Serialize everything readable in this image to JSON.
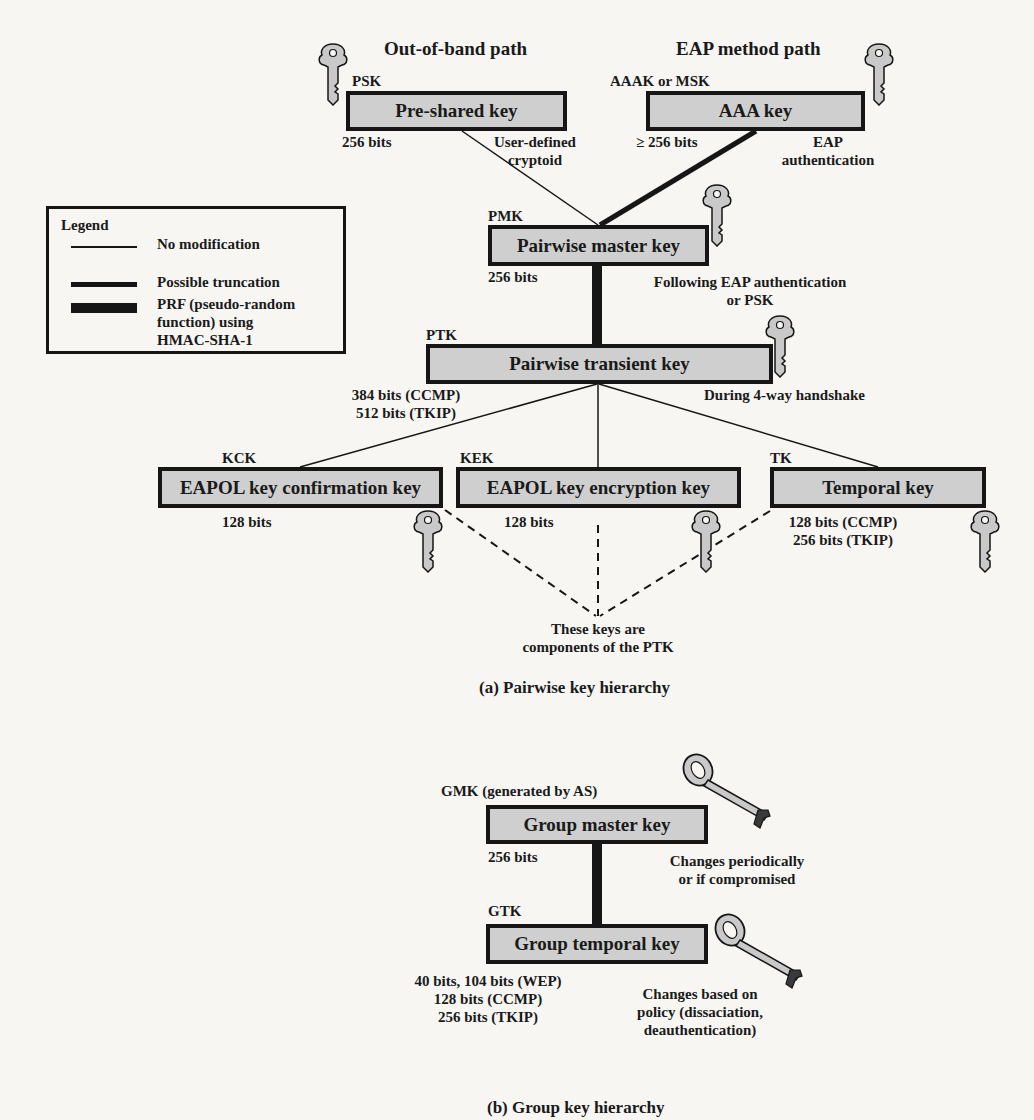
{
  "pairwise": {
    "paths": {
      "out_of_band": "Out-of-band path",
      "eap_method": "EAP method path"
    },
    "psk": {
      "abbr": "PSK",
      "name": "Pre-shared key",
      "size": "256 bits",
      "note": "User-defined\ncryptoid"
    },
    "aaa": {
      "abbr": "AAAK or MSK",
      "name": "AAA key",
      "size": "≥ 256 bits",
      "note": "EAP\nauthentication"
    },
    "pmk": {
      "abbr": "PMK",
      "name": "Pairwise master key",
      "size": "256 bits",
      "note": "Following EAP authentication\nor PSK"
    },
    "ptk": {
      "abbr": "PTK",
      "name": "Pairwise transient key",
      "size": "384 bits (CCMP)\n512 bits (TKIP)",
      "note": "During 4-way handshake"
    },
    "kck": {
      "abbr": "KCK",
      "name": "EAPOL key confirmation key",
      "size": "128 bits"
    },
    "kek": {
      "abbr": "KEK",
      "name": "EAPOL key encryption key",
      "size": "128 bits"
    },
    "tk": {
      "abbr": "TK",
      "name": "Temporal key",
      "size": "128 bits (CCMP)\n256 bits (TKIP)"
    },
    "components_note": "These keys are\ncomponents of the PTK",
    "caption": "(a) Pairwise key hierarchy"
  },
  "legend": {
    "title": "Legend",
    "items": [
      {
        "label": "No modification",
        "line": "thin"
      },
      {
        "label": "Possible truncation",
        "line": "medium"
      },
      {
        "label": "PRF (pseudo-random\nfunction) using\nHMAC-SHA-1",
        "line": "thick"
      }
    ]
  },
  "group": {
    "gmk": {
      "abbr": "GMK (generated by AS)",
      "name": "Group master key",
      "size": "256 bits",
      "note": "Changes periodically\nor if compromised"
    },
    "gtk": {
      "abbr": "GTK",
      "name": "Group temporal key",
      "size": "40 bits, 104 bits (WEP)\n128 bits (CCMP)\n256 bits (TKIP)",
      "note": "Changes based on\npolicy (dissaciation,\ndeauthentication)"
    },
    "caption": "(b) Group key hierarchy"
  },
  "colors": {
    "box_fill": "#cfcfcf",
    "ink": "#161616",
    "paper": "#f7f6f3",
    "key_fill": "#c9c9c9"
  }
}
